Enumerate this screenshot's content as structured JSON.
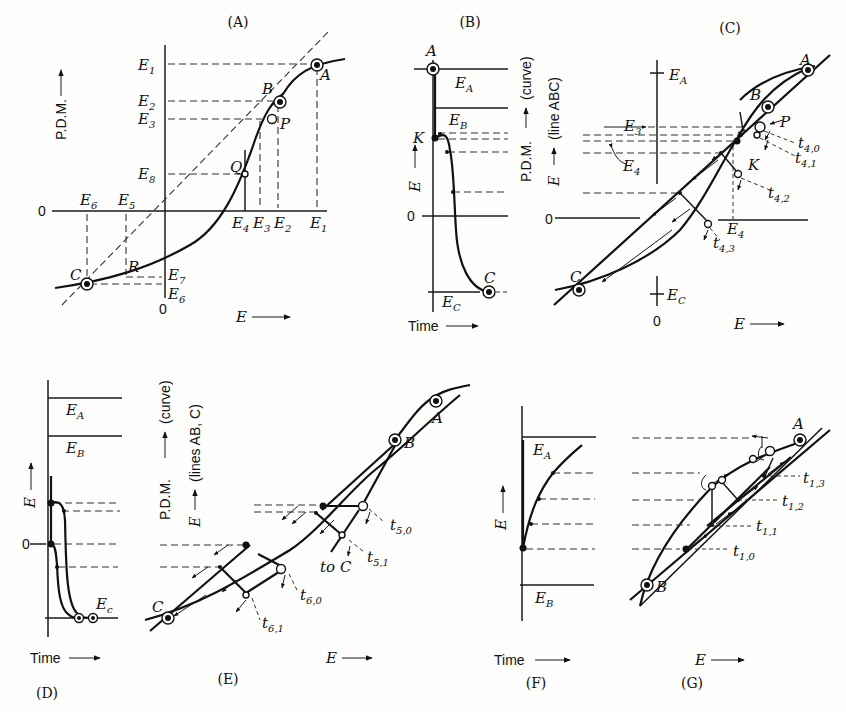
{
  "figure": {
    "panels": [
      {
        "id": "A",
        "title": "(A)",
        "ylabel": "P.D.M.",
        "xlabel": "E",
        "y_levels": [
          "E1",
          "E2",
          "E3",
          "E8"
        ],
        "x_levels": [
          "E4",
          "E3",
          "E2",
          "E1"
        ],
        "neg_x_levels": [
          "E6",
          "E5"
        ],
        "neg_y_levels": [
          "E7",
          "E6"
        ],
        "points": [
          "A",
          "B",
          "P",
          "Q",
          "R",
          "C"
        ],
        "origin": "0"
      },
      {
        "id": "B",
        "title": "(B)",
        "ylabel": "E",
        "xlabel": "Time",
        "levels": [
          "EA",
          "EB",
          "EC"
        ],
        "points": [
          "A",
          "K",
          "C"
        ],
        "origin": "0"
      },
      {
        "id": "C",
        "title": "(C)",
        "ylabel_curve": "P.D.M. (curve)",
        "ylabel_line": "E (line ABC)",
        "xlabel": "E",
        "levels": [
          "EA",
          "EC",
          "E3",
          "E4"
        ],
        "points": [
          "A",
          "B",
          "P",
          "K",
          "C"
        ],
        "time_labels": [
          "t4,0",
          "t4,1",
          "t4,2",
          "t4,3"
        ],
        "origin": "0"
      },
      {
        "id": "D",
        "title": "(D)",
        "ylabel": "E",
        "xlabel": "Time",
        "levels": [
          "EA",
          "EB",
          "Ec"
        ],
        "origin": "0"
      },
      {
        "id": "E",
        "title": "(E)",
        "ylabel_curve": "P.D.M. (curve)",
        "ylabel_line": "E (lines AB, C)",
        "xlabel": "E",
        "points": [
          "A",
          "B",
          "C",
          "C"
        ],
        "extra": "to",
        "time_labels": [
          "t5,0",
          "t5,1",
          "t6,0",
          "t6,1"
        ]
      },
      {
        "id": "F",
        "title": "(F)",
        "ylabel": "E",
        "xlabel": "Time",
        "levels": [
          "EA",
          "EB"
        ]
      },
      {
        "id": "G",
        "title": "(G)",
        "xlabel": "E",
        "points": [
          "A",
          "B"
        ],
        "time_labels": [
          "t1,3",
          "t1,2",
          "t1,1",
          "t1,0"
        ]
      }
    ]
  },
  "text": {
    "A_title": "(A)",
    "B_title": "(B)",
    "C_title": "(C)",
    "D_title": "(D)",
    "E_title": "(E)",
    "F_title": "(F)",
    "G_title": "(G)",
    "pdm": "P.D.M.",
    "curve": "(curve)",
    "lineABC": "(line ABC)",
    "linesABC": "(lines AB, C)",
    "time": "Time",
    "E": "E",
    "zero": "0",
    "arrow": "⟶",
    "uparrow": "⟶",
    "to": "to"
  }
}
